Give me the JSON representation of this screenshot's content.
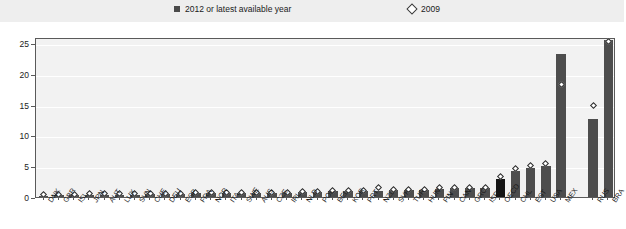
{
  "legend": {
    "entries": [
      {
        "label": "2012 or latest available year",
        "marker": "filled-square-icon",
        "color": "#4a4a4a"
      },
      {
        "label": "2009",
        "marker": "open-diamond-icon",
        "color": "#ffffff"
      }
    ]
  },
  "axes": {
    "y_ticks": [
      "0",
      "5",
      "10",
      "15",
      "20",
      "25"
    ],
    "y_min": 0,
    "y_max": 26,
    "y_label": "",
    "x_label": ""
  },
  "colors": {
    "bar": "#4d4d4d",
    "bar_highlight": "#141414",
    "plot_background": "#f2f2f2",
    "legend_band": "#eeeeee",
    "axis": "#5a5a5a",
    "grid": "#ffffff"
  },
  "chart_data": {
    "type": "bar",
    "title": "",
    "subtitle": "",
    "xlabel": "",
    "ylabel": "",
    "ylim": [
      0,
      26
    ],
    "grid": true,
    "legend_position": "top",
    "categories": [
      "DNK",
      "GBR",
      "ISL",
      "JPN",
      "AUT",
      "LUX",
      "SVN",
      "CHE",
      "DEU",
      "ESP",
      "FRA",
      "NOR",
      "ITA",
      "SWE",
      "AUS",
      "CZE",
      "IRL",
      "NLD",
      "POL",
      "BEL",
      "KOR",
      "PRT",
      "NZL",
      "SVK",
      "TUR",
      "HUN",
      "FIN",
      "CAN",
      "GRC",
      "ISR",
      "OECD",
      "CHL",
      "EST",
      "USA",
      "MEX",
      "RUS",
      "BRA"
    ],
    "highlight_categories": [
      "OECD"
    ],
    "series": [
      {
        "name": "2012 or latest available year",
        "type": "bar",
        "values": [
          0.2,
          0.3,
          0.3,
          0.4,
          0.4,
          0.4,
          0.4,
          0.5,
          0.5,
          0.5,
          0.6,
          0.6,
          0.6,
          0.6,
          0.7,
          0.7,
          0.7,
          0.8,
          0.8,
          0.9,
          0.9,
          1.0,
          1.0,
          1.1,
          1.1,
          1.2,
          1.3,
          1.4,
          1.4,
          1.5,
          3.0,
          4.2,
          4.7,
          5.0,
          23.3,
          12.7,
          25.5
        ]
      },
      {
        "name": "2009",
        "type": "scatter",
        "values": [
          0.4,
          0.4,
          0.4,
          0.5,
          0.6,
          0.6,
          0.5,
          0.6,
          0.6,
          0.6,
          0.7,
          0.7,
          0.7,
          0.7,
          0.8,
          0.8,
          0.8,
          0.9,
          0.9,
          1.0,
          1.0,
          1.1,
          1.6,
          1.2,
          1.3,
          1.3,
          1.5,
          1.6,
          1.6,
          1.6,
          3.3,
          4.7,
          5.2,
          5.4,
          18.3,
          14.8,
          25.3
        ]
      }
    ]
  },
  "groups": {
    "gap_after_category": "MEX"
  }
}
